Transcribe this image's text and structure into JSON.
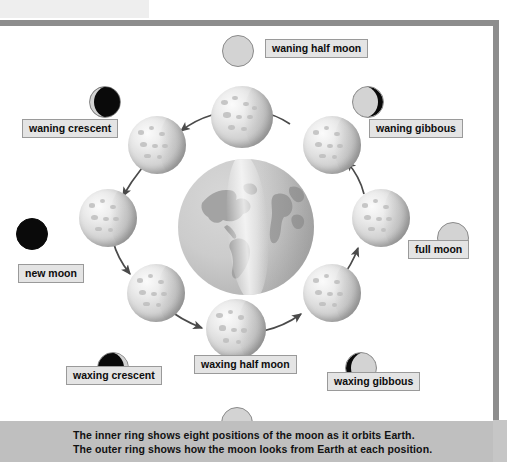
{
  "diagram": {
    "caption": "The inner ring shows eight positions of the moon as it orbits Earth. The outer ring shows how the moon looks from Earth at each position.",
    "center_body": "Earth",
    "colors": {
      "frame": "#8d8d8d",
      "caption_band": "#bfbfbf",
      "label_fill": "#e4e4e4",
      "label_border": "#9a9a9a",
      "moon_lit": "#d3d3d3",
      "moon_dark": "#0a0a0a",
      "arrow": "#4a4a4a",
      "page_background": "#ffffff"
    },
    "phase_count": 8,
    "phases": [
      {
        "id": "waning-half-moon",
        "label": "waning half moon",
        "lit_side": "left",
        "illumination": "half"
      },
      {
        "id": "waning-crescent",
        "label": "waning crescent",
        "lit_side": "left",
        "illumination": "crescent"
      },
      {
        "id": "new-moon",
        "label": "new moon",
        "lit_side": "none",
        "illumination": "none"
      },
      {
        "id": "waxing-crescent",
        "label": "waxing crescent",
        "lit_side": "right",
        "illumination": "crescent"
      },
      {
        "id": "waxing-half-moon",
        "label": "waxing half moon",
        "lit_side": "right",
        "illumination": "half"
      },
      {
        "id": "waxing-gibbous",
        "label": "waxing gibbous",
        "lit_side": "right",
        "illumination": "gibbous"
      },
      {
        "id": "full-moon",
        "label": "full moon",
        "lit_side": "both",
        "illumination": "full"
      },
      {
        "id": "waning-gibbous",
        "label": "waning gibbous",
        "lit_side": "left",
        "illumination": "gibbous"
      }
    ]
  }
}
